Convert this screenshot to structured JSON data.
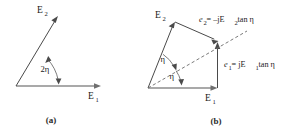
{
  "figure": {
    "background_color": "#ffffff",
    "line_color": "#4a4a4a",
    "axis_color": "#8c8c8c",
    "dash_color": "#6b6b6b",
    "text_color": "#1a1a1a"
  },
  "panel_a": {
    "caption": "(a)",
    "labels": {
      "e1": "E",
      "e1_sub": "1",
      "e2": "E",
      "e2_sub": "2",
      "angle": "2η"
    },
    "geometry": {
      "origin": [
        16,
        86
      ],
      "e1_tip": [
        101,
        86
      ],
      "e2_tip": [
        58,
        17
      ],
      "angle_deg": 39
    }
  },
  "panel_b": {
    "caption": "(b)",
    "labels": {
      "e1": "E",
      "e1_sub": "1",
      "e2": "E",
      "e2_sub": "2",
      "angle_upper": "η",
      "angle_lower": "η",
      "eq_e2_lead": "e",
      "eq_e2_lead_sub": "2",
      "eq_e2_rest": " = –jE",
      "eq_e2_rest_sub": "2",
      "eq_e2_tail": " tan η",
      "eq_e1_lead": "e",
      "eq_e1_lead_sub": "1",
      "eq_e1_rest": " = jE",
      "eq_e1_rest_sub": "1",
      "eq_e1_tail": " tan η"
    },
    "geometry": {
      "origin": [
        148,
        88
      ],
      "e1_tip": [
        217,
        88
      ],
      "e2_tip": [
        175,
        23
      ],
      "resultant": [
        218,
        42
      ],
      "angle_upper_deg": 17,
      "angle_lower_deg": 17
    }
  }
}
